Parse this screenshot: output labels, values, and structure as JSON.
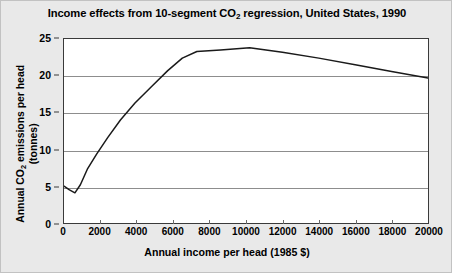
{
  "chart_data": {
    "type": "line",
    "title": "Income effects from 10-segment CO2 regression, United States, 1990",
    "title_parts": {
      "before": "Income effects from 10-segment CO",
      "sub": "2",
      "after": " regression, United States, 1990"
    },
    "xlabel": "Annual income per head (1985 $)",
    "ylabel": "Annual CO2 emissions per head (tonnes)",
    "ylabel_parts": {
      "line1_before": "Annual CO",
      "line1_sub": "2",
      "line1_after": " emissions per head",
      "line2": "(tonnes)"
    },
    "xlim": [
      0,
      20000
    ],
    "ylim": [
      0,
      25
    ],
    "xticks": [
      0,
      2000,
      4000,
      6000,
      8000,
      10000,
      12000,
      14000,
      16000,
      18000,
      20000
    ],
    "xticklabels": [
      "0",
      "2000",
      "4000",
      "6000",
      "8000",
      "10000",
      "12000",
      "14000",
      "16000",
      "18000",
      "20000"
    ],
    "yticks": [
      0,
      5,
      10,
      15,
      20,
      25
    ],
    "yticklabels": [
      "0",
      "5",
      "10",
      "15",
      "20",
      "25"
    ],
    "grid": "horizontal",
    "legend": "none",
    "series": [
      {
        "name": "CO2 emissions per head",
        "color": "#1a1a1a",
        "x": [
          0,
          300,
          600,
          900,
          1300,
          1800,
          2400,
          3100,
          3900,
          4800,
          5700,
          6500,
          7300,
          8600,
          10200,
          12000,
          14000,
          16000,
          18000,
          20000
        ],
        "y": [
          5.0,
          4.5,
          4.1,
          5.2,
          7.4,
          9.4,
          11.6,
          14.0,
          16.3,
          18.5,
          20.7,
          22.4,
          23.3,
          23.5,
          23.8,
          23.2,
          22.4,
          21.5,
          20.6,
          19.7
        ]
      }
    ]
  },
  "colors": {
    "figure_background": "#e9e9e9",
    "plot_background": "#ffffff",
    "gridline": "#8d8d8d",
    "axis": "#3a3a3a",
    "series": "#1a1a1a",
    "text": "#000000"
  }
}
